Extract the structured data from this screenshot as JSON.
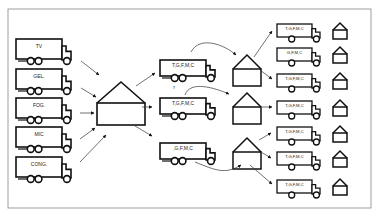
{
  "diagram": {
    "colors": {
      "line": "#111111",
      "arrow": "#333333",
      "frame": "#888888",
      "background": "#ffffff"
    },
    "source_trucks": [
      {
        "label": "TV"
      },
      {
        "label": "GEL."
      },
      {
        "label": "FOG."
      },
      {
        "label": "MIC"
      },
      {
        "label": "CONG."
      }
    ],
    "central_warehouse": {
      "icon": "warehouse-icon"
    },
    "mid_trucks": [
      {
        "label": "T,G,F,M,C",
        "note": "T"
      },
      {
        "label": "T,G,F,M,C",
        "note": ""
      },
      {
        "label": ",G,F,M,C",
        "note": ""
      }
    ],
    "regional_warehouses": [
      {
        "icon": "warehouse-icon"
      },
      {
        "icon": "warehouse-icon"
      },
      {
        "icon": "warehouse-icon"
      }
    ],
    "final_trucks": [
      {
        "label": "T,G,F,M,C"
      },
      {
        "label": "G,F,M,C"
      },
      {
        "label": "T,G,F,M,C"
      },
      {
        "label": "T,G,F,M,C"
      },
      {
        "label": "T,G,F,M,C"
      },
      {
        "label": "T,G,F,M,C"
      },
      {
        "label": "T,G,F,M,C"
      }
    ]
  }
}
